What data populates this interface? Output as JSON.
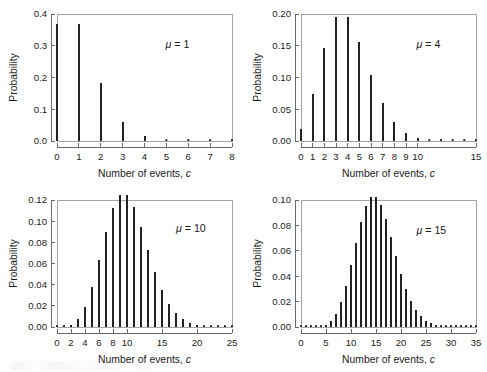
{
  "figure": {
    "background": "#ffffff",
    "bar_color": "#222222",
    "frame_color": "#9a9a9a",
    "axis_color": "#5a5a5a",
    "panel_count": 4,
    "layout": "2x2 grid"
  },
  "chart_data": [
    {
      "type": "bar",
      "title": "",
      "annotation": "μ = 1",
      "mu": 1,
      "xlabel": "Number of events, c",
      "ylabel": "Probability",
      "xlim": [
        0,
        8
      ],
      "ylim": [
        0,
        0.4
      ],
      "xticks": [
        0,
        1,
        2,
        3,
        4,
        5,
        6,
        7,
        8
      ],
      "xtick_labels": [
        "0",
        "1",
        "2",
        "3",
        "4",
        "5",
        "6",
        "7",
        "8"
      ],
      "yticks": [
        0.0,
        0.1,
        0.2,
        0.3,
        0.4
      ],
      "ytick_labels": [
        "0.0",
        "0.1",
        "0.2",
        "0.3",
        "0.4"
      ],
      "grid": false,
      "legend": "none",
      "categories": [
        0,
        1,
        2,
        3,
        4,
        5,
        6,
        7,
        8
      ],
      "values": [
        0.3679,
        0.3679,
        0.1839,
        0.0613,
        0.0153,
        0.0031,
        0.0005,
        0.0001,
        0.0
      ]
    },
    {
      "type": "bar",
      "title": "",
      "annotation": "μ = 4",
      "mu": 4,
      "xlabel": "Number of events, c",
      "ylabel": "Probability",
      "xlim": [
        0,
        15
      ],
      "ylim": [
        0,
        0.2
      ],
      "xticks": [
        0,
        1,
        2,
        3,
        4,
        5,
        6,
        7,
        8,
        9,
        10,
        15
      ],
      "xtick_labels": [
        "0",
        "1",
        "2",
        "3",
        "4",
        "5",
        "6",
        "7",
        "8",
        "9",
        "10",
        "15"
      ],
      "yticks": [
        0.0,
        0.05,
        0.1,
        0.15,
        0.2
      ],
      "ytick_labels": [
        "0.00",
        "0.05",
        "0.10",
        "0.15",
        "0.20"
      ],
      "grid": false,
      "legend": "none",
      "categories": [
        0,
        1,
        2,
        3,
        4,
        5,
        6,
        7,
        8,
        9,
        10,
        11,
        12,
        13,
        14,
        15
      ],
      "values": [
        0.0183,
        0.0733,
        0.1465,
        0.1954,
        0.1954,
        0.1563,
        0.1042,
        0.0595,
        0.0298,
        0.0132,
        0.0053,
        0.0019,
        0.0006,
        0.0002,
        0.0001,
        0.0
      ]
    },
    {
      "type": "bar",
      "title": "",
      "annotation": "μ = 10",
      "mu": 10,
      "xlabel": "Number of events, c",
      "ylabel": "Probability",
      "xlim": [
        0,
        25
      ],
      "ylim": [
        0,
        0.12
      ],
      "xticks": [
        0,
        2,
        4,
        6,
        8,
        10,
        15,
        20,
        25
      ],
      "xtick_labels": [
        "0",
        "2",
        "4",
        "6",
        "8",
        "10",
        "15",
        "20",
        "25"
      ],
      "yticks": [
        0.0,
        0.02,
        0.04,
        0.06,
        0.08,
        0.1,
        0.12
      ],
      "ytick_labels": [
        "0.00",
        "0.02",
        "0.04",
        "0.06",
        "0.08",
        "0.10",
        "0.12"
      ],
      "grid": false,
      "legend": "none",
      "categories": [
        0,
        1,
        2,
        3,
        4,
        5,
        6,
        7,
        8,
        9,
        10,
        11,
        12,
        13,
        14,
        15,
        16,
        17,
        18,
        19,
        20,
        21,
        22,
        23,
        24,
        25
      ],
      "values": [
        0.0,
        0.0005,
        0.0023,
        0.0076,
        0.0189,
        0.0378,
        0.0631,
        0.0901,
        0.1126,
        0.1251,
        0.1251,
        0.1137,
        0.0948,
        0.0729,
        0.0521,
        0.0347,
        0.0217,
        0.0128,
        0.0071,
        0.0037,
        0.0019,
        0.0009,
        0.0004,
        0.0002,
        0.0001,
        0.0
      ]
    },
    {
      "type": "bar",
      "title": "",
      "annotation": "μ = 15",
      "mu": 15,
      "xlabel": "Number of events, c",
      "ylabel": "Probability",
      "xlim": [
        0,
        35
      ],
      "ylim": [
        0,
        0.1
      ],
      "xticks": [
        0,
        5,
        10,
        15,
        20,
        25,
        30,
        35
      ],
      "xtick_labels": [
        "0",
        "5",
        "10",
        "15",
        "20",
        "25",
        "30",
        "35"
      ],
      "yticks": [
        0.0,
        0.02,
        0.04,
        0.06,
        0.08,
        0.1
      ],
      "ytick_labels": [
        "0.00",
        "0.02",
        "0.04",
        "0.06",
        "0.08",
        "0.10"
      ],
      "grid": false,
      "legend": "none",
      "categories": [
        0,
        1,
        2,
        3,
        4,
        5,
        6,
        7,
        8,
        9,
        10,
        11,
        12,
        13,
        14,
        15,
        16,
        17,
        18,
        19,
        20,
        21,
        22,
        23,
        24,
        25,
        26,
        27,
        28,
        29,
        30,
        31,
        32,
        33,
        34,
        35
      ],
      "values": [
        0.0,
        0.0,
        0.0,
        0.0002,
        0.0006,
        0.0019,
        0.0048,
        0.0104,
        0.0194,
        0.0324,
        0.0486,
        0.0663,
        0.0829,
        0.0956,
        0.1024,
        0.1024,
        0.096,
        0.0847,
        0.0706,
        0.0557,
        0.0418,
        0.0299,
        0.0204,
        0.0133,
        0.0083,
        0.005,
        0.0029,
        0.0016,
        0.0008,
        0.0004,
        0.0002,
        0.0001,
        0.0,
        0.0,
        0.0,
        0.0
      ]
    }
  ]
}
